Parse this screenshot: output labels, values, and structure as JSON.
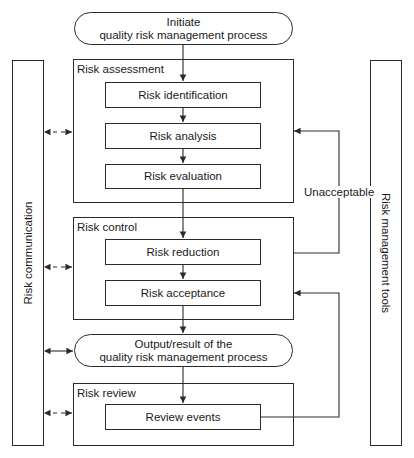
{
  "diagram": {
    "start": {
      "line1": "Initiate",
      "line2": "quality risk management process"
    },
    "groups": {
      "assessment": {
        "label": "Risk assessment",
        "steps": [
          "Risk identification",
          "Risk analysis",
          "Risk evaluation"
        ]
      },
      "control": {
        "label": "Risk control",
        "steps": [
          "Risk reduction",
          "Risk acceptance"
        ]
      },
      "review": {
        "label": "Risk review",
        "steps": [
          "Review events"
        ]
      }
    },
    "output": {
      "line1": "Output/result of the",
      "line2": "quality risk management process"
    },
    "side_left": "Risk communication",
    "side_right": "Risk management tools",
    "feedback_label": "Unacceptable",
    "colors": {
      "line": "#2a2a2a",
      "background": "#ffffff"
    }
  }
}
